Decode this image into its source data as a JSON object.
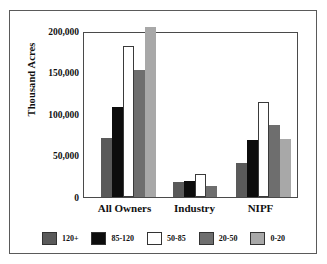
{
  "chart_data": {
    "type": "bar",
    "title": "",
    "subtitle": "",
    "xlabel": "",
    "ylabel": "Thousand Acres",
    "categories": [
      "All Owners",
      "Industry",
      "NIPF"
    ],
    "ylim": [
      0,
      200000
    ],
    "yticks": [
      0,
      50000,
      100000,
      150000,
      200000
    ],
    "ytick_labels": [
      "0",
      "50,000",
      "100,000",
      "150,000",
      "200,000"
    ],
    "grid": false,
    "legend_position": "bottom",
    "note": "The 0-20 bar for All Owners exceeds the 200,000 axis maximum and is clipped at the top of the plot area.",
    "series": [
      {
        "name": "120+",
        "color": "#5a5a5a",
        "values": [
          71500,
          18000,
          41000
        ]
      },
      {
        "name": "85-120",
        "color": "#0d0d0d",
        "values": [
          108000,
          19000,
          69000
        ]
      },
      {
        "name": "50-85",
        "color": "#ffffff",
        "values": [
          182000,
          28000,
          114000
        ]
      },
      {
        "name": "20-50",
        "color": "#6e6e6e",
        "values": [
          153000,
          13000,
          87000
        ]
      },
      {
        "name": "0-20",
        "color": "#a8a8a8",
        "values": [
          205000,
          0,
          70000
        ]
      }
    ]
  },
  "legend": {
    "items": [
      {
        "label": "120+",
        "color": "#5a5a5a"
      },
      {
        "label": "85-120",
        "color": "#0d0d0d"
      },
      {
        "label": "50-85",
        "color": "#ffffff"
      },
      {
        "label": "20-50",
        "color": "#6e6e6e"
      },
      {
        "label": "0-20",
        "color": "#a8a8a8"
      }
    ]
  },
  "axis": {
    "y_title": "Thousand Acres",
    "y_labels": [
      "200,000",
      "150,000",
      "100,000",
      "50,000",
      "0"
    ],
    "x_labels": [
      "All Owners",
      "Industry",
      "NIPF"
    ]
  }
}
